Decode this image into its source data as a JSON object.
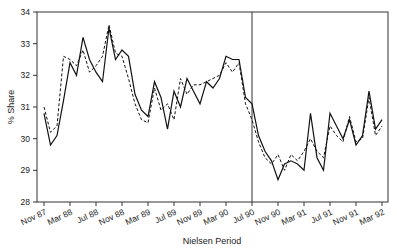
{
  "chart_data": {
    "type": "line",
    "title": "",
    "xlabel": "Nielsen Period",
    "ylabel": "% Share",
    "ylim": [
      28,
      34
    ],
    "yticks": [
      28,
      29,
      30,
      31,
      32,
      33,
      34
    ],
    "xtick_labels": [
      "Nov 87",
      "Mar 88",
      "Jul 88",
      "Nov 88",
      "Mar 89",
      "Jul 89",
      "Nov 89",
      "Mar 90",
      "Jul 90",
      "Nov 90",
      "Mar 91",
      "Jul 91",
      "Nov 91",
      "Mar 92"
    ],
    "grid": false,
    "legend": null,
    "annotations": [
      {
        "type": "vertical-line",
        "at": "Jul 90"
      }
    ],
    "x": [
      "Nov 87",
      "Dec 87",
      "Jan 88",
      "Feb 88",
      "Mar 88",
      "Apr 88",
      "May 88",
      "Jun 88",
      "Jul 88",
      "Aug 88",
      "Sep 88",
      "Oct 88",
      "Nov 88",
      "Dec 88",
      "Jan 89",
      "Feb 89",
      "Mar 89",
      "Apr 89",
      "May 89",
      "Jun 89",
      "Jul 89",
      "Aug 89",
      "Sep 89",
      "Oct 89",
      "Nov 89",
      "Dec 89",
      "Jan 90",
      "Feb 90",
      "Mar 90",
      "Apr 90",
      "May 90",
      "Jun 90",
      "Jul 90",
      "Aug 90",
      "Sep 90",
      "Oct 90",
      "Nov 90",
      "Dec 90",
      "Jan 91",
      "Feb 91",
      "Mar 91",
      "Apr 91",
      "May 91",
      "Jun 91",
      "Jul 91",
      "Aug 91",
      "Sep 91",
      "Oct 91",
      "Nov 91",
      "Dec 91",
      "Jan 92",
      "Feb 92",
      "Mar 92"
    ],
    "series": [
      {
        "name": "Actual",
        "style": "solid",
        "values": [
          30.8,
          29.8,
          30.1,
          31.2,
          32.4,
          32.0,
          33.2,
          32.5,
          32.1,
          31.8,
          33.5,
          32.5,
          32.8,
          32.6,
          31.4,
          30.9,
          30.7,
          31.8,
          31.3,
          30.3,
          31.5,
          31.0,
          31.9,
          31.5,
          31.1,
          31.8,
          31.6,
          31.9,
          32.6,
          32.5,
          32.5,
          31.3,
          31.1,
          30.1,
          29.6,
          29.3,
          28.7,
          29.2,
          29.3,
          29.2,
          29.0,
          30.8,
          29.4,
          29.0,
          30.8,
          30.4,
          30.0,
          30.6,
          29.8,
          30.1,
          31.5,
          30.3,
          30.6
        ]
      },
      {
        "name": "Fitted",
        "style": "dashed",
        "values": [
          31.0,
          30.2,
          30.4,
          32.6,
          32.5,
          32.3,
          32.8,
          32.1,
          32.3,
          32.6,
          33.6,
          32.7,
          32.6,
          31.9,
          31.1,
          30.6,
          30.5,
          31.6,
          30.9,
          31.1,
          30.6,
          31.9,
          31.4,
          31.7,
          31.7,
          31.8,
          31.9,
          32.0,
          32.4,
          32.1,
          32.4,
          31.1,
          30.6,
          29.9,
          29.4,
          29.2,
          29.5,
          29.0,
          29.5,
          29.3,
          29.6,
          30.0,
          29.6,
          29.4,
          30.4,
          30.1,
          29.9,
          30.7,
          29.9,
          30.0,
          31.3,
          30.1,
          30.4
        ]
      }
    ]
  }
}
